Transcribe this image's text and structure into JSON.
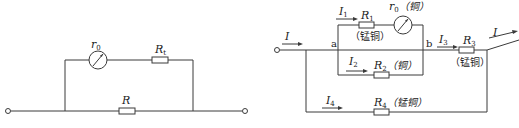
{
  "left_circuit": {
    "meter": {
      "symbol": "r",
      "subscript": "0"
    },
    "series_resistor": {
      "symbol": "R",
      "subscript": "t"
    },
    "shunt_resistor": {
      "symbol": "R"
    }
  },
  "right_circuit": {
    "input_current": "I",
    "output_current": "I",
    "node_a": "a",
    "node_b": "b",
    "branch1": {
      "current": {
        "symbol": "I",
        "subscript": "1"
      },
      "resistor": {
        "symbol": "R",
        "subscript": "1",
        "material": "（锰铜）"
      },
      "meter": {
        "symbol": "r",
        "subscript": "0",
        "material": "（铜）"
      }
    },
    "branch2": {
      "current": {
        "symbol": "I",
        "subscript": "2"
      },
      "resistor": {
        "symbol": "R",
        "subscript": "2",
        "material": "（铜）"
      }
    },
    "branch3": {
      "current": {
        "symbol": "I",
        "subscript": "3"
      },
      "resistor": {
        "symbol": "R",
        "subscript": "3",
        "material": "（锰铜）"
      }
    },
    "branch4": {
      "current": {
        "symbol": "I",
        "subscript": "4"
      },
      "resistor": {
        "symbol": "R",
        "subscript": "4",
        "material": "（锰铜）"
      }
    }
  },
  "colors": {
    "line": "#3a3a3a",
    "text": "#222222",
    "background": "#ffffff"
  }
}
